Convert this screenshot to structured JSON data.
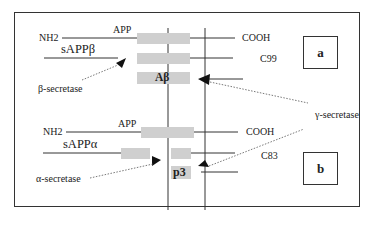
{
  "panel_a": {
    "label": "a",
    "nh2": "NH2",
    "app": "APP",
    "cooh": "COOH",
    "fragment_n": "sAPPβ",
    "fragment_c": "C99",
    "peptide": "Aβ",
    "n_secretase": "β-secretase"
  },
  "panel_b": {
    "label": "b",
    "nh2": "NH2",
    "app": "APP",
    "cooh": "COOH",
    "fragment_n": "sAPPα",
    "fragment_c": "C83",
    "peptide": "p3",
    "n_secretase": "α-secretase"
  },
  "shared": {
    "c_secretase": "γ-secretase"
  },
  "colors": {
    "bar": "#cfcfcf",
    "line": "#333333"
  }
}
